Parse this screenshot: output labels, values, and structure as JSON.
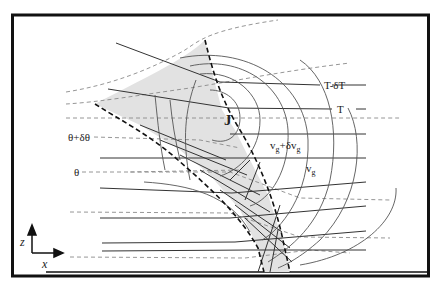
{
  "figure": {
    "type": "schematic cross-section",
    "colors": {
      "frame": "#111111",
      "shaded_region": "#e2e2e2",
      "solid_lines": "#333333",
      "dashed_lines": "#888888",
      "front_boundary": "#111111"
    }
  },
  "labels": {
    "jet_core": "J",
    "temperature_upper": "T-δT",
    "temperature": "T",
    "theta_upper": "θ+δθ",
    "theta": "θ",
    "wind_upper_base": "v",
    "wind_upper_sub": "g",
    "wind_upper_plus": "+δv",
    "wind_upper_sub2": "g",
    "wind_lower_base": "v",
    "wind_lower_sub": "g"
  },
  "axes": {
    "vertical_label": "z",
    "horizontal_label": "x"
  },
  "legend_items": [
    {
      "key": "solid_horizontal",
      "meaning": "isotherms (T, T-δT)"
    },
    {
      "key": "dashed_gray",
      "meaning": "isentropes (θ, θ+δθ)"
    },
    {
      "key": "curved_contours",
      "meaning": "geostrophic wind isotachs (v_g, v_g+δv_g)"
    },
    {
      "key": "shaded_dashed_band",
      "meaning": "frontal zone"
    }
  ]
}
